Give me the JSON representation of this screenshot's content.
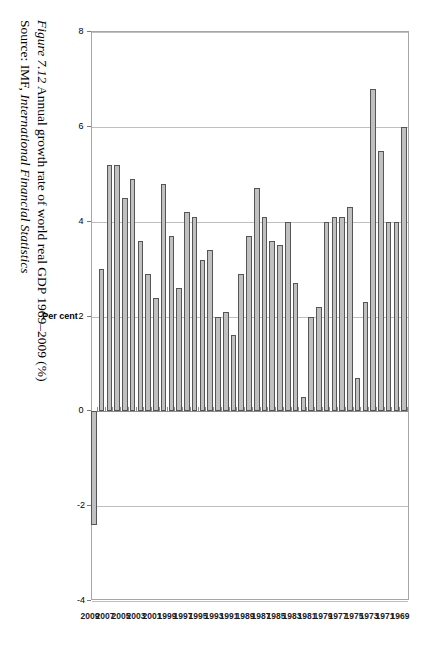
{
  "figure": {
    "caption_number": "Figure 7.12",
    "caption_text": "Annual growth rate of world real GDP 1969–2009 (%)",
    "source_prefix": "Source:",
    "source_org": "IMF,",
    "source_pub": "International Financial Statistics"
  },
  "chart_data": {
    "type": "bar",
    "title": "Annual growth rate of world real GDP 1969–2009 (%)",
    "orientation": "vertical-bars-rotated",
    "xlabel": "",
    "ylabel": "Per cent",
    "ylim": [
      -4,
      8
    ],
    "yticks": [
      8,
      6,
      4,
      2,
      0,
      -2,
      -4
    ],
    "ytick_labels": [
      "8",
      "6",
      "4",
      "2",
      "0",
      "-2",
      "-4"
    ],
    "grid": true,
    "legend": "none",
    "bar_fill": "#c0c0c0",
    "bar_stroke": "#555555",
    "category_label_interval": 2,
    "categories": [
      "1969",
      "1970",
      "1971",
      "1972",
      "1973",
      "1974",
      "1975",
      "1976",
      "1977",
      "1978",
      "1979",
      "1980",
      "1981",
      "1982",
      "1983",
      "1984",
      "1985",
      "1986",
      "1987",
      "1988",
      "1989",
      "1990",
      "1991",
      "1992",
      "1993",
      "1994",
      "1995",
      "1996",
      "1997",
      "1998",
      "1999",
      "2000",
      "2001",
      "2002",
      "2003",
      "2004",
      "2005",
      "2006",
      "2007",
      "2008",
      "2009"
    ],
    "values": [
      6.0,
      4.0,
      4.0,
      5.5,
      6.8,
      2.3,
      0.7,
      4.3,
      4.1,
      4.1,
      4.0,
      2.2,
      2.0,
      0.3,
      2.7,
      4.0,
      3.5,
      3.6,
      4.1,
      4.7,
      3.7,
      2.9,
      1.6,
      2.1,
      2.0,
      3.4,
      3.2,
      4.1,
      4.2,
      2.6,
      3.7,
      4.8,
      2.4,
      2.9,
      3.6,
      4.9,
      4.5,
      5.2,
      5.2,
      3.0,
      -2.4
    ],
    "shown_tick_categories": [
      "1969",
      "1971",
      "1973",
      "1975",
      "1977",
      "1979",
      "1981",
      "1983",
      "1985",
      "1987",
      "1989",
      "1991",
      "1993",
      "1995",
      "1997",
      "1999",
      "2001",
      "2003",
      "2005",
      "2007",
      "2009"
    ]
  }
}
